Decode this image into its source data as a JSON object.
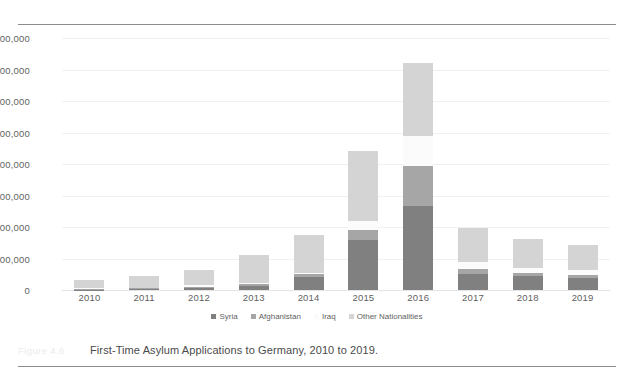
{
  "figure": {
    "number_label": "Figure 4.6",
    "caption": "First-Time Asylum Applications to Germany, 2010 to 2019."
  },
  "colors": {
    "syria": "#808080",
    "afghanistan": "#a6a6a6",
    "iraq": "#fbfbfb",
    "other": "#d4d4d4",
    "gridline": "#f0f0f0",
    "rule": "#8c8c8c",
    "text": "#5f5f5f"
  },
  "chart_data": {
    "type": "bar",
    "stacked": true,
    "title": "First-Time Asylum Applications to Germany, 2010 to 2019.",
    "xlabel": "",
    "ylabel": "",
    "ylim": [
      0,
      800000
    ],
    "ytick_labels": [
      "800,000",
      "700,000",
      "600,000",
      "500,000",
      "400,000",
      "300,000",
      "200,000",
      "100,000",
      "0"
    ],
    "ytick_values": [
      800000,
      700000,
      600000,
      500000,
      400000,
      300000,
      200000,
      100000,
      0
    ],
    "grid": true,
    "legend_position": "bottom",
    "categories": [
      "2010",
      "2011",
      "2012",
      "2013",
      "2014",
      "2015",
      "2016",
      "2017",
      "2018",
      "2019"
    ],
    "series": [
      {
        "name": "Syria",
        "color": "#808080",
        "values": [
          1500,
          2600,
          6200,
          12000,
          41000,
          159000,
          266000,
          50000,
          44000,
          39000
        ]
      },
      {
        "name": "Afghanistan",
        "color": "#a6a6a6",
        "values": [
          2000,
          2700,
          3400,
          7700,
          9100,
          31000,
          127000,
          16400,
          9900,
          9500
        ]
      },
      {
        "name": "Iraq",
        "color": "#fbfbfb",
        "values": [
          2700,
          2000,
          5300,
          4000,
          5300,
          29800,
          96100,
          21200,
          16300,
          13700
        ]
      },
      {
        "name": "Other Nationalities",
        "color": "#d4d4d4",
        "values": [
          25000,
          37000,
          49000,
          86000,
          118000,
          222000,
          233000,
          110000,
          92000,
          80000
        ]
      }
    ],
    "totals": [
      31200,
      44300,
      63900,
      109700,
      173400,
      441800,
      722100,
      197600,
      162200,
      142200
    ]
  },
  "legend": {
    "items": [
      {
        "label": "Syria"
      },
      {
        "label": "Afghanistan"
      },
      {
        "label": "Iraq"
      },
      {
        "label": "Other Nationalities"
      }
    ]
  }
}
